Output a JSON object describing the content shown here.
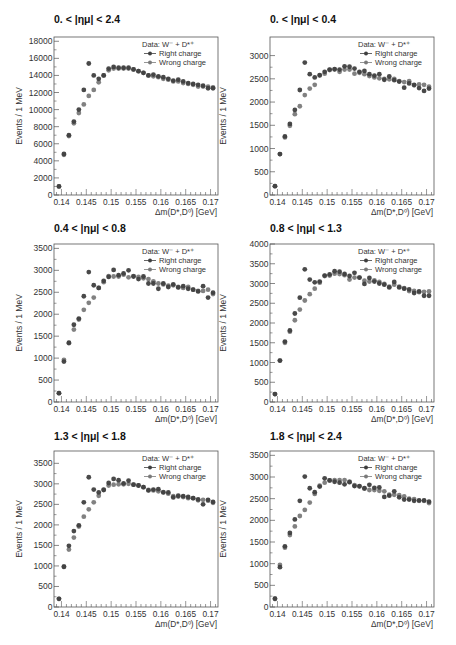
{
  "figure": {
    "legend": {
      "header": "Data: W⁻ + D*⁺",
      "right_label": "Right charge",
      "wrong_label": "Wrong charge"
    },
    "xlabel": "Δm(D*,D⁰) [GeV]",
    "ylabel": "Events / 1 MeV",
    "colors": {
      "right": "#3f3f3f",
      "wrong": "#7a7a7a",
      "frame": "#555555"
    }
  },
  "chart_data": [
    {
      "type": "scatter",
      "title": "0. < |ημ| < 2.4",
      "xlabel": "Δm(D*,D⁰) [GeV]",
      "ylabel": "Events / 1 MeV",
      "xlim": [
        0.1385,
        0.1715
      ],
      "ylim": [
        0,
        18500
      ],
      "yticks": [
        0,
        2000,
        4000,
        6000,
        8000,
        10000,
        12000,
        14000,
        16000,
        18000
      ],
      "xticks": [
        0.14,
        0.145,
        0.15,
        0.155,
        0.16,
        0.165,
        0.17
      ],
      "x": [
        0.1395,
        0.1405,
        0.1415,
        0.1425,
        0.1435,
        0.1445,
        0.1455,
        0.1465,
        0.1475,
        0.1485,
        0.1495,
        0.1505,
        0.1515,
        0.1525,
        0.1535,
        0.1545,
        0.1555,
        0.1565,
        0.1575,
        0.1585,
        0.1595,
        0.1605,
        0.1615,
        0.1625,
        0.1635,
        0.1645,
        0.1655,
        0.1665,
        0.1675,
        0.1685,
        0.1695,
        0.1705
      ],
      "series": [
        {
          "name": "Right charge",
          "values": [
            1000,
            4800,
            7000,
            8600,
            10000,
            12300,
            15400,
            14000,
            13600,
            14000,
            14800,
            15000,
            14900,
            14900,
            14900,
            14700,
            14500,
            14300,
            14000,
            14100,
            13900,
            13800,
            13600,
            13400,
            13500,
            13300,
            13100,
            13000,
            12900,
            12800,
            12500,
            12500
          ]
        },
        {
          "name": "Wrong charge",
          "values": [
            1000,
            4700,
            6900,
            8400,
            9600,
            10600,
            11600,
            12300,
            13200,
            14000,
            14600,
            14800,
            14800,
            14800,
            14800,
            14700,
            14500,
            14300,
            14000,
            13900,
            13800,
            13600,
            13500,
            13300,
            13300,
            13100,
            13000,
            12900,
            12700,
            12700,
            12700,
            12600
          ]
        }
      ],
      "legend_position": "top-right"
    },
    {
      "type": "scatter",
      "title": "0. < |ημ| < 0.4",
      "xlabel": "Δm(D*,D⁰) [GeV]",
      "ylabel": "Events / 1 MeV",
      "xlim": [
        0.1385,
        0.1715
      ],
      "ylim": [
        0,
        3400
      ],
      "yticks": [
        0,
        500,
        1000,
        1500,
        2000,
        2500,
        3000
      ],
      "xticks": [
        0.14,
        0.145,
        0.15,
        0.155,
        0.16,
        0.165,
        0.17
      ],
      "x": [
        0.1395,
        0.1405,
        0.1415,
        0.1425,
        0.1435,
        0.1445,
        0.1455,
        0.1465,
        0.1475,
        0.1485,
        0.1495,
        0.1505,
        0.1515,
        0.1525,
        0.1535,
        0.1545,
        0.1555,
        0.1565,
        0.1575,
        0.1585,
        0.1595,
        0.1605,
        0.1615,
        0.1625,
        0.1635,
        0.1645,
        0.1655,
        0.1665,
        0.1675,
        0.1685,
        0.1695,
        0.1705
      ],
      "series": [
        {
          "name": "Right charge",
          "values": [
            190,
            880,
            1260,
            1530,
            1830,
            2260,
            2850,
            2600,
            2530,
            2580,
            2650,
            2700,
            2710,
            2700,
            2770,
            2760,
            2720,
            2650,
            2670,
            2600,
            2570,
            2600,
            2480,
            2550,
            2470,
            2440,
            2310,
            2400,
            2370,
            2300,
            2240,
            2290
          ]
        },
        {
          "name": "Wrong charge",
          "values": [
            190,
            880,
            1240,
            1490,
            1740,
            1910,
            2150,
            2290,
            2370,
            2570,
            2610,
            2690,
            2700,
            2650,
            2700,
            2700,
            2610,
            2630,
            2600,
            2560,
            2530,
            2510,
            2500,
            2490,
            2500,
            2450,
            2430,
            2450,
            2360,
            2380,
            2370,
            2330
          ]
        }
      ],
      "legend_position": "top-right"
    },
    {
      "type": "scatter",
      "title": "0.4 < |ημ| < 0.8",
      "xlabel": "Δm(D*,D⁰) [GeV]",
      "ylabel": "Events / 1 MeV",
      "xlim": [
        0.1385,
        0.1715
      ],
      "ylim": [
        0,
        3600
      ],
      "yticks": [
        0,
        500,
        1000,
        1500,
        2000,
        2500,
        3000,
        3500
      ],
      "xticks": [
        0.14,
        0.145,
        0.15,
        0.155,
        0.16,
        0.165,
        0.17
      ],
      "x": [
        0.1395,
        0.1405,
        0.1415,
        0.1425,
        0.1435,
        0.1445,
        0.1455,
        0.1465,
        0.1475,
        0.1485,
        0.1495,
        0.1505,
        0.1515,
        0.1525,
        0.1535,
        0.1545,
        0.1555,
        0.1565,
        0.1575,
        0.1585,
        0.1595,
        0.1605,
        0.1615,
        0.1625,
        0.1635,
        0.1645,
        0.1655,
        0.1665,
        0.1675,
        0.1685,
        0.1695,
        0.1705
      ],
      "series": [
        {
          "name": "Right charge",
          "values": [
            200,
            920,
            1350,
            1760,
            1900,
            2410,
            2960,
            2660,
            2600,
            2760,
            2850,
            3010,
            2890,
            2930,
            3000,
            2860,
            2800,
            2860,
            2700,
            2700,
            2580,
            2700,
            2620,
            2680,
            2610,
            2640,
            2580,
            2560,
            2520,
            2640,
            2380,
            2490
          ]
        },
        {
          "name": "Wrong charge",
          "values": [
            200,
            960,
            1340,
            1650,
            1880,
            2100,
            2260,
            2380,
            2600,
            2730,
            2870,
            2860,
            2860,
            2900,
            2840,
            2870,
            2850,
            2820,
            2800,
            2750,
            2700,
            2680,
            2650,
            2660,
            2620,
            2600,
            2620,
            2560,
            2530,
            2530,
            2560,
            2460
          ]
        }
      ],
      "legend_position": "top-right"
    },
    {
      "type": "scatter",
      "title": "0.8 < |ημ| < 1.3",
      "xlabel": "Δm(D*,D⁰) [GeV]",
      "ylabel": "Events / 1 MeV",
      "xlim": [
        0.1385,
        0.1715
      ],
      "ylim": [
        0,
        4000
      ],
      "yticks": [
        0,
        500,
        1000,
        1500,
        2000,
        2500,
        3000,
        3500,
        4000
      ],
      "xticks": [
        0.14,
        0.145,
        0.15,
        0.155,
        0.16,
        0.165,
        0.17
      ],
      "x": [
        0.1395,
        0.1405,
        0.1415,
        0.1425,
        0.1435,
        0.1445,
        0.1455,
        0.1465,
        0.1475,
        0.1485,
        0.1495,
        0.1505,
        0.1515,
        0.1525,
        0.1535,
        0.1545,
        0.1555,
        0.1565,
        0.1575,
        0.1585,
        0.1595,
        0.1605,
        0.1615,
        0.1625,
        0.1635,
        0.1645,
        0.1655,
        0.1665,
        0.1675,
        0.1685,
        0.1695,
        0.1705
      ],
      "series": [
        {
          "name": "Right charge",
          "values": [
            200,
            1050,
            1530,
            1810,
            2240,
            2640,
            3360,
            3100,
            3030,
            3050,
            3200,
            3230,
            3310,
            3300,
            3240,
            3190,
            3270,
            3150,
            2990,
            3140,
            3050,
            3000,
            2970,
            2900,
            3040,
            2900,
            2870,
            2850,
            2760,
            2800,
            2690,
            2690
          ]
        },
        {
          "name": "Wrong charge",
          "values": [
            200,
            1050,
            1500,
            1780,
            2070,
            2340,
            2570,
            2730,
            2870,
            3020,
            3190,
            3200,
            3250,
            3240,
            3210,
            3100,
            3150,
            3150,
            3070,
            3050,
            3080,
            3040,
            2990,
            2920,
            2970,
            2920,
            2880,
            2810,
            2810,
            2780,
            2790,
            2800
          ]
        }
      ],
      "legend_position": "top-right"
    },
    {
      "type": "scatter",
      "title": "1.3 < |ημ| < 1.8",
      "xlabel": "Δm(D*,D⁰) [GeV]",
      "ylabel": "Events / 1 MeV",
      "xlim": [
        0.1385,
        0.1715
      ],
      "ylim": [
        0,
        3800
      ],
      "yticks": [
        0,
        500,
        1000,
        1500,
        2000,
        2500,
        3000,
        3500
      ],
      "xticks": [
        0.14,
        0.145,
        0.15,
        0.155,
        0.16,
        0.165,
        0.17
      ],
      "x": [
        0.1395,
        0.1405,
        0.1415,
        0.1425,
        0.1435,
        0.1445,
        0.1455,
        0.1465,
        0.1475,
        0.1485,
        0.1495,
        0.1505,
        0.1515,
        0.1525,
        0.1535,
        0.1545,
        0.1555,
        0.1565,
        0.1575,
        0.1585,
        0.1595,
        0.1605,
        0.1615,
        0.1625,
        0.1635,
        0.1645,
        0.1655,
        0.1665,
        0.1675,
        0.1685,
        0.1695,
        0.1705
      ],
      "series": [
        {
          "name": "Right charge",
          "values": [
            200,
            980,
            1490,
            1850,
            1990,
            2550,
            3160,
            2860,
            2790,
            2850,
            3020,
            3120,
            3090,
            3010,
            3080,
            2980,
            2960,
            2920,
            2840,
            2860,
            2870,
            2790,
            2790,
            2670,
            2710,
            2700,
            2680,
            2650,
            2620,
            2500,
            2610,
            2560
          ]
        },
        {
          "name": "Wrong charge",
          "values": [
            200,
            980,
            1400,
            1690,
            1960,
            2200,
            2380,
            2550,
            2710,
            2860,
            2960,
            2980,
            2990,
            2990,
            3000,
            2980,
            2960,
            2920,
            2850,
            2840,
            2820,
            2800,
            2760,
            2700,
            2690,
            2680,
            2650,
            2650,
            2600,
            2610,
            2590,
            2540
          ]
        }
      ],
      "legend_position": "top-right"
    },
    {
      "type": "scatter",
      "title": "1.8 < |ημ| < 2.4",
      "xlabel": "Δm(D*,D⁰) [GeV]",
      "ylabel": "Events / 1 MeV",
      "xlim": [
        0.1385,
        0.1715
      ],
      "ylim": [
        0,
        3600
      ],
      "yticks": [
        0,
        500,
        1000,
        1500,
        2000,
        2500,
        3000,
        3500
      ],
      "xticks": [
        0.14,
        0.145,
        0.15,
        0.155,
        0.16,
        0.165,
        0.17
      ],
      "x": [
        0.1395,
        0.1405,
        0.1415,
        0.1425,
        0.1435,
        0.1445,
        0.1455,
        0.1465,
        0.1475,
        0.1485,
        0.1495,
        0.1505,
        0.1515,
        0.1525,
        0.1535,
        0.1545,
        0.1555,
        0.1565,
        0.1575,
        0.1585,
        0.1595,
        0.1605,
        0.1615,
        0.1625,
        0.1635,
        0.1645,
        0.1655,
        0.1665,
        0.1675,
        0.1685,
        0.1695,
        0.1705
      ],
      "series": [
        {
          "name": "Right charge",
          "values": [
            190,
            920,
            1400,
            1710,
            2020,
            2450,
            3010,
            2740,
            2650,
            2780,
            2970,
            2920,
            2890,
            2870,
            2830,
            2880,
            2790,
            2790,
            2740,
            2820,
            2750,
            2760,
            2540,
            2570,
            2670,
            2530,
            2480,
            2480,
            2450,
            2460,
            2460,
            2430
          ]
        },
        {
          "name": "Wrong charge",
          "values": [
            190,
            970,
            1370,
            1660,
            1860,
            2100,
            2240,
            2410,
            2610,
            2800,
            2870,
            2920,
            2930,
            2930,
            2930,
            2890,
            2810,
            2780,
            2730,
            2700,
            2700,
            2680,
            2670,
            2590,
            2590,
            2580,
            2550,
            2500,
            2490,
            2450,
            2450,
            2400
          ]
        }
      ],
      "legend_position": "top-right"
    }
  ]
}
